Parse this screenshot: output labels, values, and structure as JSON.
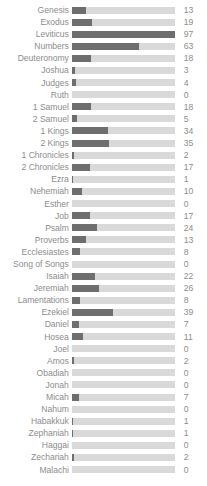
{
  "chart_data": {
    "type": "bar",
    "title": "",
    "subtitle": "",
    "xlabel": "",
    "ylabel": "",
    "orientation": "horizontal",
    "grid": false,
    "legend": false,
    "value_labels": true,
    "xlim": [
      0,
      97
    ],
    "max_value": 97,
    "track_color": "#d9d9d9",
    "bar_color": "#6e6e6e",
    "text_color": "#8d8d8d",
    "categories": [
      "Genesis",
      "Exodus",
      "Leviticus",
      "Numbers",
      "Deuteronomy",
      "Joshua",
      "Judges",
      "Ruth",
      "1 Samuel",
      "2 Samuel",
      "1 Kings",
      "2 Kings",
      "1 Chronicles",
      "2 Chronicles",
      "Ezra",
      "Nehemiah",
      "Esther",
      "Job",
      "Psalm",
      "Proverbs",
      "Ecclesiastes",
      "Song of Songs",
      "Isaiah",
      "Jeremiah",
      "Lamentations",
      "Ezekiel",
      "Daniel",
      "Hosea",
      "Joel",
      "Amos",
      "Obadiah",
      "Jonah",
      "Micah",
      "Nahum",
      "Habakkuk",
      "Zephaniah",
      "Haggai",
      "Zechariah",
      "Malachi"
    ],
    "values": [
      13,
      19,
      97,
      63,
      18,
      3,
      4,
      0,
      18,
      5,
      34,
      35,
      2,
      17,
      1,
      10,
      0,
      17,
      24,
      13,
      8,
      0,
      22,
      26,
      8,
      39,
      7,
      11,
      0,
      2,
      0,
      0,
      7,
      0,
      1,
      1,
      0,
      2,
      0
    ]
  }
}
